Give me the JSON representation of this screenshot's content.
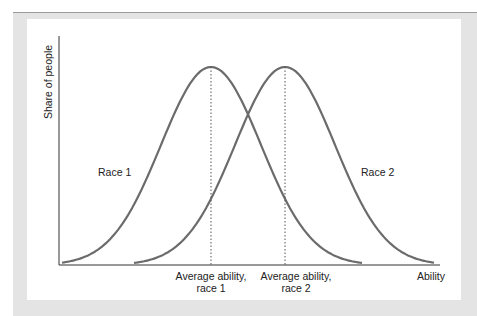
{
  "chart_data": {
    "type": "line",
    "title": "",
    "xlabel": "Ability",
    "ylabel": "Share of people",
    "grid": false,
    "series": [
      {
        "name": "Race 1",
        "mean_label": "Average ability, race 1",
        "shape": "normal-curve",
        "peak_x": 211
      },
      {
        "name": "Race 2",
        "mean_label": "Average ability, race 2",
        "shape": "normal-curve",
        "peak_x": 285
      }
    ],
    "annotations": [
      "dotted vertical line at each mean"
    ]
  },
  "labels": {
    "y_axis": "Share of people",
    "x_axis": "Ability",
    "race1": "Race 1",
    "race2": "Race 2",
    "mean1_line1": "Average ability,",
    "mean1_line2": "race 1",
    "mean2_line1": "Average ability,",
    "mean2_line2": "race 2"
  },
  "colors": {
    "curve": "#6b6b6b",
    "axis": "#333333",
    "frame": "#e4e4e4"
  }
}
